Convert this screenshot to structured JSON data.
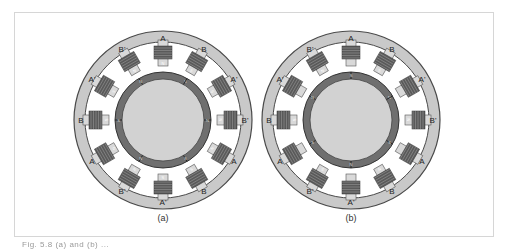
{
  "figure": {
    "caption": "Fig. 5.8  (a) and (b) ...",
    "colors": {
      "stator_ring": "#c9c9c9",
      "stator_edge": "#4a4a4a",
      "pole": "#d9d9d9",
      "coil": "#5a5a5a",
      "rotor_ring": "#6f6f6f",
      "rotor_core": "#d2d2d2"
    },
    "panels": [
      {
        "id": "a",
        "label": "(a)",
        "center": [
          163,
          120
        ],
        "rotor_divider_offset_deg": 0,
        "poles": [
          {
            "angle": -90,
            "label": "A",
            "tip": "N"
          },
          {
            "angle": -60,
            "label": "B",
            "tip": "S"
          },
          {
            "angle": -30,
            "label": "A'",
            "tip": "S"
          },
          {
            "angle": 0,
            "label": "B'",
            "tip": "N"
          },
          {
            "angle": 30,
            "label": "A",
            "tip": "N"
          },
          {
            "angle": 60,
            "label": "B",
            "tip": "S"
          },
          {
            "angle": 90,
            "label": "A'",
            "tip": "S"
          },
          {
            "angle": 120,
            "label": "B'",
            "tip": "N"
          },
          {
            "angle": 150,
            "label": "A",
            "tip": "N"
          },
          {
            "angle": 180,
            "label": "B",
            "tip": "S"
          },
          {
            "angle": 210,
            "label": "A'",
            "tip": "S"
          },
          {
            "angle": 240,
            "label": "B'",
            "tip": "N"
          }
        ],
        "rotor_segments": [
          "S",
          "N",
          "S",
          "N",
          "S",
          "N"
        ]
      },
      {
        "id": "b",
        "label": "(b)",
        "center": [
          351,
          120
        ],
        "rotor_divider_offset_deg": 30,
        "poles": [
          {
            "angle": -90,
            "label": "A",
            "tip": ""
          },
          {
            "angle": -60,
            "label": "B",
            "tip": "S"
          },
          {
            "angle": -30,
            "label": "A'",
            "tip": ""
          },
          {
            "angle": 0,
            "label": "B'",
            "tip": "N"
          },
          {
            "angle": 30,
            "label": "A",
            "tip": ""
          },
          {
            "angle": 60,
            "label": "B",
            "tip": "N"
          },
          {
            "angle": 90,
            "label": "A'",
            "tip": ""
          },
          {
            "angle": 120,
            "label": "B'",
            "tip": "S"
          },
          {
            "angle": 150,
            "label": "A",
            "tip": ""
          },
          {
            "angle": 180,
            "label": "B",
            "tip": "S"
          },
          {
            "angle": 210,
            "label": "A'",
            "tip": ""
          },
          {
            "angle": 240,
            "label": "B'",
            "tip": "N"
          }
        ],
        "rotor_segments": [
          "N",
          "S",
          "N",
          "S",
          "N",
          "S"
        ]
      }
    ]
  }
}
